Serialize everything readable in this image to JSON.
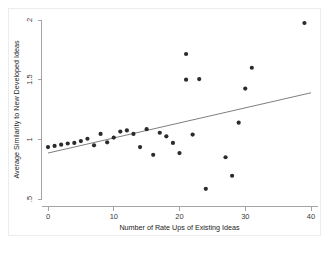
{
  "chart_data": {
    "type": "scatter",
    "title": "",
    "xlabel": "Number of Rate Ups of Existing Ideas",
    "ylabel": "Average Similarity to New Developed Ideas",
    "xlim": [
      -1.2,
      41
    ],
    "ylim": [
      0.5,
      2.05
    ],
    "grid": false,
    "legend": null,
    "xticks": [
      "0",
      "10",
      "20",
      "30",
      "40"
    ],
    "xtick_values": [
      0,
      10,
      20,
      30,
      40
    ],
    "yticks": [
      ".5",
      "1",
      "1.5",
      "2"
    ],
    "ytick_values": [
      0.5,
      1,
      1.5,
      2
    ],
    "marker_color": "#2b2b2b",
    "line_color": "#6f6f6f",
    "axis_color": "#9a9a9a",
    "frame_color": "#ececed",
    "points": [
      {
        "x": 0,
        "y": 0.935
      },
      {
        "x": 1,
        "y": 0.945
      },
      {
        "x": 2,
        "y": 0.955
      },
      {
        "x": 3,
        "y": 0.965
      },
      {
        "x": 4,
        "y": 0.97
      },
      {
        "x": 5,
        "y": 0.985
      },
      {
        "x": 6,
        "y": 1.005
      },
      {
        "x": 7,
        "y": 0.95
      },
      {
        "x": 8,
        "y": 1.045
      },
      {
        "x": 9,
        "y": 0.975
      },
      {
        "x": 10,
        "y": 1.015
      },
      {
        "x": 11,
        "y": 1.065
      },
      {
        "x": 12,
        "y": 1.075
      },
      {
        "x": 13,
        "y": 1.045
      },
      {
        "x": 14,
        "y": 0.935
      },
      {
        "x": 15,
        "y": 1.085
      },
      {
        "x": 16,
        "y": 0.87
      },
      {
        "x": 17,
        "y": 1.055
      },
      {
        "x": 18,
        "y": 1.025
      },
      {
        "x": 19,
        "y": 0.97
      },
      {
        "x": 20,
        "y": 0.885
      },
      {
        "x": 21,
        "y": 1.715
      },
      {
        "x": 21,
        "y": 1.5
      },
      {
        "x": 22,
        "y": 1.04
      },
      {
        "x": 23,
        "y": 1.505
      },
      {
        "x": 24,
        "y": 0.585
      },
      {
        "x": 27,
        "y": 0.85
      },
      {
        "x": 28,
        "y": 0.695
      },
      {
        "x": 29,
        "y": 1.14
      },
      {
        "x": 30,
        "y": 1.425
      },
      {
        "x": 31,
        "y": 1.6
      },
      {
        "x": 39,
        "y": 1.975
      }
    ],
    "fit_line": {
      "x_start": 0,
      "y_start": 0.885,
      "x_end": 40,
      "y_end": 1.39
    }
  },
  "notes": {
    "top_caption": "",
    "bottom_caption": ""
  }
}
